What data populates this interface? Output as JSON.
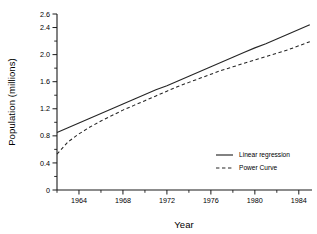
{
  "chart_data": {
    "type": "line",
    "title": "",
    "xlabel": "Year",
    "ylabel": "Population (millions)",
    "xlim": [
      1962,
      1985.2
    ],
    "ylim": [
      0,
      2.6
    ],
    "grid": false,
    "legend_position": "center-right-inside",
    "x_ticks": [
      1964,
      1968,
      1972,
      1976,
      1980,
      1984
    ],
    "x_tick_labels": [
      "1964",
      "1968",
      "1972",
      "1976",
      "1980",
      "1984"
    ],
    "x_minor_tick_interval": 2,
    "y_ticks": [
      0,
      0.4,
      0.8,
      1.2,
      1.6,
      2.0,
      2.4,
      2.6
    ],
    "y_tick_labels": [
      "0",
      "0.4",
      "0.8",
      "1.2",
      "1.6",
      "2.0",
      "2.4",
      "2.6"
    ],
    "y_minor_tick_interval": 0.2,
    "x": [
      1962,
      1963,
      1964,
      1965,
      1966,
      1967,
      1968,
      1969,
      1970,
      1971,
      1972,
      1973,
      1974,
      1975,
      1976,
      1977,
      1978,
      1979,
      1980,
      1981,
      1982,
      1983,
      1984,
      1985
    ],
    "series": [
      {
        "name": "Linear regression",
        "style": "solid",
        "color": "#262626",
        "values": [
          0.85,
          0.92,
          0.99,
          1.06,
          1.13,
          1.2,
          1.27,
          1.34,
          1.41,
          1.48,
          1.54,
          1.61,
          1.68,
          1.75,
          1.82,
          1.89,
          1.96,
          2.03,
          2.1,
          2.16,
          2.23,
          2.3,
          2.37,
          2.44
        ]
      },
      {
        "name": "Power Curve",
        "style": "dashed",
        "color": "#262626",
        "values": [
          0.53,
          0.71,
          0.83,
          0.93,
          1.02,
          1.1,
          1.18,
          1.25,
          1.32,
          1.39,
          1.46,
          1.53,
          1.59,
          1.65,
          1.71,
          1.77,
          1.82,
          1.87,
          1.92,
          1.97,
          2.02,
          2.07,
          2.13,
          2.19
        ]
      }
    ],
    "legend_entries": [
      {
        "label": "Linear regression",
        "style": "solid"
      },
      {
        "label": "Power Curve",
        "style": "dashed"
      }
    ]
  }
}
